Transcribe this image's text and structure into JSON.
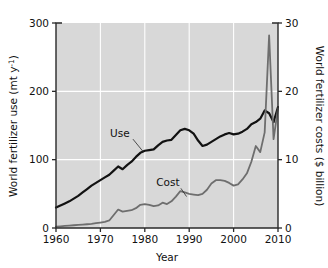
{
  "chart_data": {
    "type": "line",
    "title": "",
    "xlabel": "Year",
    "ylabel": "World fertilizer use (mt y-1)",
    "ylabel_left_main": "World fertilizer use (mt y",
    "ylabel_left_sup": "-1",
    "ylabel_left_tail": ")",
    "ylabel_right": "World fertilizer costs ($ billion)",
    "xlim": [
      1960,
      2010
    ],
    "ylim_left": [
      0,
      300
    ],
    "ylim_right": [
      0,
      30
    ],
    "grid": true,
    "legend_position": "inline-annotations",
    "xticks": [
      1960,
      1970,
      1980,
      1990,
      2000,
      2010
    ],
    "xtick_labels": [
      "1960",
      "1970",
      "1980",
      "1990",
      "2000",
      "2010"
    ],
    "yticks_left": [
      0,
      100,
      200,
      300
    ],
    "ytick_labels_left": [
      "0",
      "100",
      "200",
      "300"
    ],
    "yticks_right": [
      0,
      10,
      20,
      30
    ],
    "ytick_labels_right": [
      "0",
      "10",
      "20",
      "30"
    ],
    "plot_bg_color": "#d8d8d8",
    "grid_color": "#ffffff",
    "frame_color": "#2a2a2a",
    "series": [
      {
        "name": "Use",
        "label": "Use",
        "axis": "left",
        "color": "#121212",
        "line_width": 2.2,
        "annotation": {
          "text": "Use",
          "x": 1974.4,
          "y": 133,
          "leader_to_x": 1979.6,
          "leader_to_y": 112
        },
        "x": [
          1960,
          1961,
          1962,
          1963,
          1964,
          1965,
          1966,
          1967,
          1968,
          1969,
          1970,
          1971,
          1972,
          1973,
          1974,
          1975,
          1976,
          1977,
          1978,
          1979,
          1980,
          1981,
          1982,
          1983,
          1984,
          1985,
          1986,
          1987,
          1988,
          1989,
          1990,
          1991,
          1992,
          1993,
          1994,
          1995,
          1996,
          1997,
          1998,
          1999,
          2000,
          2001,
          2002,
          2003,
          2004,
          2005,
          2006,
          2007,
          2008,
          2009,
          2010
        ],
        "y": [
          30,
          33,
          36,
          39,
          43,
          47,
          52,
          57,
          62,
          66,
          70,
          74,
          78,
          84,
          90,
          86,
          92,
          97,
          104,
          110,
          113,
          114,
          115,
          121,
          126,
          128,
          129,
          136,
          143,
          145,
          143,
          138,
          128,
          120,
          122,
          126,
          130,
          134,
          137,
          139,
          137,
          138,
          141,
          145,
          152,
          155,
          160,
          172,
          168,
          155,
          177
        ]
      },
      {
        "name": "Cost",
        "label": "Cost",
        "axis": "right",
        "color": "#6e6e6e",
        "line_width": 1.8,
        "annotation": {
          "text": "Cost",
          "x": 1985.2,
          "y": 6.1,
          "leader_to_x": 1989.4,
          "leader_to_y": 4.6
        },
        "x": [
          1960,
          1961,
          1962,
          1963,
          1964,
          1965,
          1966,
          1967,
          1968,
          1969,
          1970,
          1971,
          1972,
          1973,
          1974,
          1975,
          1976,
          1977,
          1978,
          1979,
          1980,
          1981,
          1982,
          1983,
          1984,
          1985,
          1986,
          1987,
          1988,
          1989,
          1990,
          1991,
          1992,
          1993,
          1994,
          1995,
          1996,
          1997,
          1998,
          1999,
          2000,
          2001,
          2002,
          2003,
          2004,
          2005,
          2006,
          2007,
          2008,
          2009,
          2010
        ],
        "y": [
          0.2,
          0.25,
          0.3,
          0.35,
          0.4,
          0.45,
          0.5,
          0.55,
          0.6,
          0.7,
          0.8,
          0.9,
          1.1,
          1.9,
          2.7,
          2.4,
          2.5,
          2.6,
          2.9,
          3.4,
          3.5,
          3.4,
          3.2,
          3.3,
          3.7,
          3.5,
          3.9,
          4.6,
          5.4,
          5.2,
          5.0,
          4.9,
          4.8,
          5.0,
          5.6,
          6.5,
          7.0,
          7.0,
          6.9,
          6.6,
          6.2,
          6.4,
          7.1,
          8.0,
          9.7,
          12.0,
          11.1,
          14.0,
          28.2,
          13.0,
          17.5
        ]
      }
    ]
  },
  "geometry": {
    "plot_left": 56,
    "plot_top": 23,
    "plot_right": 278,
    "plot_bottom": 228
  }
}
